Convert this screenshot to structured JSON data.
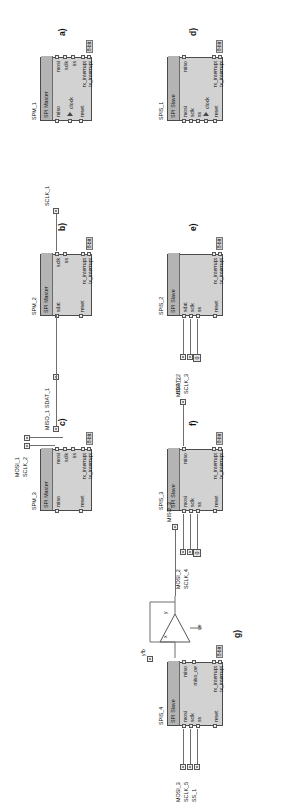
{
  "figure": {
    "rotation_deg": -90,
    "bit_annotation": "8-bit",
    "constant_zero": "0"
  },
  "blocks": [
    {
      "id": "a",
      "caption": "a)",
      "instance": "SPM_1",
      "type": "SPI Master",
      "inputs": [
        "miso",
        "clock",
        "reset"
      ],
      "outputs": [
        "mosi",
        "sclk",
        "ss",
        "rx_interrupt",
        "tx_interrupt"
      ],
      "bus_label": "8-bit",
      "signals": []
    },
    {
      "id": "b",
      "caption": "b)",
      "instance": "SPM_2",
      "type": "SPI Master",
      "inputs": [
        "sdat",
        "reset"
      ],
      "outputs": [
        "sclk",
        "ss",
        "rx_interrupt",
        "tx_interrupt"
      ],
      "bus_label": "8-bit",
      "signals": [
        "SDAT_1",
        "SCLK_1",
        "MISO_1"
      ]
    },
    {
      "id": "c",
      "caption": "c)",
      "instance": "SPM_3",
      "type": "SPI Master",
      "inputs": [
        "miso",
        "reset"
      ],
      "outputs": [
        "mosi",
        "sclk",
        "ss",
        "rx_interrupt",
        "tx_interrupt"
      ],
      "bus_label": "8-bit",
      "signals": [
        "MOSI_1",
        "SCLK_2",
        "MISO_1"
      ]
    },
    {
      "id": "d",
      "caption": "d)",
      "instance": "SPIS_1",
      "type": "SPI Slave",
      "inputs": [
        "mosi",
        "sclk",
        "ss",
        "clock",
        "reset"
      ],
      "outputs": [
        "miso",
        "rx_interrupt",
        "tx_interrupt"
      ],
      "bus_label": "8-bit",
      "signals": []
    },
    {
      "id": "e",
      "caption": "e)",
      "instance": "SPIS_2",
      "type": "SPI Slave",
      "inputs": [
        "sdat",
        "sclk",
        "ss",
        "reset"
      ],
      "outputs": [
        "rx_interrupt",
        "tx_interrupt"
      ],
      "bus_label": "8-bit",
      "signals": [
        "SDAT_2",
        "SCLK_3",
        "0"
      ]
    },
    {
      "id": "f",
      "caption": "f)",
      "instance": "SPIS_3",
      "type": "SPI Slave",
      "inputs": [
        "mosi",
        "sclk",
        "ss",
        "reset"
      ],
      "outputs": [
        "miso",
        "rx_interrupt",
        "tx_interrupt"
      ],
      "bus_label": "8-bit",
      "signals": [
        "MOSI_2",
        "SCLK_4",
        "0",
        "MISO_2"
      ]
    },
    {
      "id": "g",
      "caption": "g)",
      "instance": "SPIS_4",
      "type": "SPI Slave",
      "inputs": [
        "mosi",
        "sclk",
        "ss",
        "reset"
      ],
      "outputs": [
        "miso",
        "miso_oe",
        "rx_interrupt",
        "tx_interrupt"
      ],
      "bus_label": "8-bit",
      "signals": [
        "MOSI_3",
        "SCLK_5",
        "SS_1",
        "MISO_3"
      ],
      "tristate": {
        "feedback_label": "yfb",
        "in_label": "x",
        "enable_label": "oe",
        "out_label": "y"
      }
    }
  ],
  "labels": {
    "spm1": "SPM_1",
    "spm2": "SPM_2",
    "spm3": "SPM_3",
    "spis1": "SPIS_1",
    "spis2": "SPIS_2",
    "spis3": "SPIS_3",
    "spis4": "SPIS_4",
    "spi_master": "SPI Master",
    "spi_slave": "SPI Slave",
    "miso": "miso",
    "mosi": "mosi",
    "sclk": "sclk",
    "ss": "ss",
    "sdat": "sdat",
    "clock": "clock",
    "reset": "reset",
    "rx_interrupt": "rx_interrupt",
    "tx_interrupt": "tx_interrupt",
    "miso_oe": "miso_oe",
    "eight_bit": "8-bit",
    "zero": "0",
    "cap_a": "a)",
    "cap_b": "b)",
    "cap_c": "c)",
    "cap_d": "d)",
    "cap_e": "e)",
    "cap_f": "f)",
    "cap_g": "g)",
    "sig_sdat1": "SDAT_1",
    "sig_sclk1": "SCLK_1",
    "sig_miso1": "MISO_1",
    "sig_mosi1": "MOSI_1",
    "sig_sclk2": "SCLK_2",
    "sig_sdat2": "SDAT_2",
    "sig_sclk3": "SCLK_3",
    "sig_mosi2": "MOSI_2",
    "sig_sclk4": "SCLK_4",
    "sig_miso2": "MISO_2",
    "sig_mosi3": "MOSI_3",
    "sig_sclk5": "SCLK_5",
    "sig_ss1": "SS_1",
    "sig_miso3": "MISO_3",
    "tri_yfb": "yfb",
    "tri_x": "x",
    "tri_oe": "oe",
    "tri_y": "y"
  }
}
